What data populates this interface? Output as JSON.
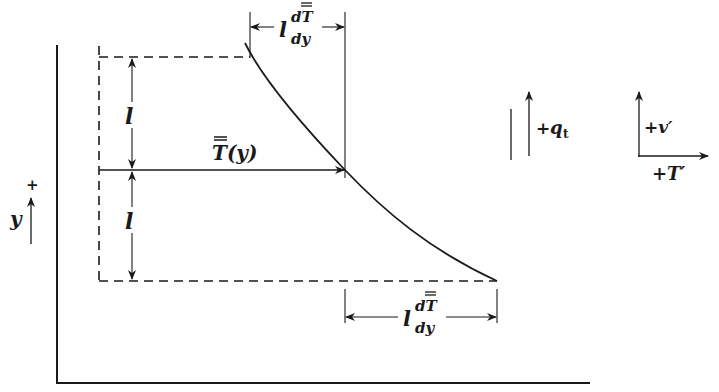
{
  "figure": {
    "colors": {
      "ink": "#1a1a1a",
      "background": "#ffffff"
    }
  },
  "labels": {
    "top_dimension": {
      "prefix": "l",
      "numerator": "dT",
      "denominator": "dy",
      "overbar": "T"
    },
    "bottom_dimension": {
      "prefix": "l",
      "numerator": "dT",
      "denominator": "dy",
      "overbar": "T"
    },
    "upper_mixing_length": "l",
    "lower_mixing_length": "l",
    "mean_profile": "T(y)",
    "y_axis_symbol": "y",
    "y_axis_sign": "+",
    "heat_flux": {
      "sign": "+",
      "symbol": "q",
      "subscript": "t"
    },
    "velocity_fluctuation": "+v′",
    "temperature_fluctuation": "+T′"
  },
  "geometry": {
    "axes_origin": [
      57,
      383
    ],
    "top_level_y": 57,
    "mid_level_y": 170,
    "bottom_level_y": 281,
    "curve_points": [
      [
        245,
        43
      ],
      [
        250,
        57
      ],
      [
        345,
        170
      ],
      [
        497,
        281
      ]
    ]
  }
}
